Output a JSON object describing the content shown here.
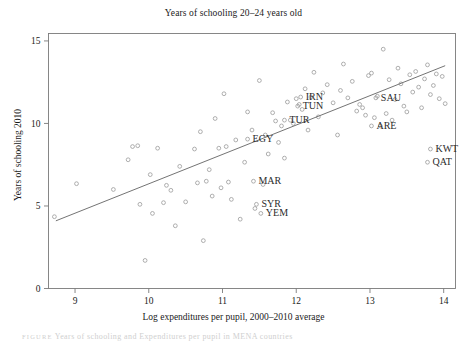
{
  "figure": {
    "title": "Years of schooling 20–24 years old",
    "caption_prefix": "FIGURE",
    "caption_text": "Years of schooling and Expenditures per pupil in MENA countries"
  },
  "chart_data": {
    "type": "scatter",
    "title": "Years of schooling 20–24 years old",
    "xlabel": "Log expenditures per pupil, 2000–2010 average",
    "ylabel": "Years of schooling 2010",
    "xlim": [
      8.64,
      14.16
    ],
    "ylim": [
      0,
      15.45
    ],
    "xticks": [
      9,
      10,
      11,
      12,
      13,
      14
    ],
    "yticks": [
      0,
      5,
      10,
      15
    ],
    "grid": false,
    "legend": "none",
    "marker": "open-circle",
    "marker_color": "#9a9a9a",
    "trendline": {
      "type": "linear-fit",
      "color": "#6b6b6b",
      "x_start": 8.74,
      "y_start": 4.1,
      "x_end": 14.02,
      "y_end": 13.5
    },
    "points": [
      {
        "x": 8.72,
        "y": 4.35
      },
      {
        "x": 9.02,
        "y": 6.35
      },
      {
        "x": 9.52,
        "y": 6.0
      },
      {
        "x": 9.72,
        "y": 7.8
      },
      {
        "x": 9.78,
        "y": 8.6
      },
      {
        "x": 9.85,
        "y": 8.65
      },
      {
        "x": 9.88,
        "y": 5.1
      },
      {
        "x": 9.95,
        "y": 1.7
      },
      {
        "x": 10.02,
        "y": 6.9
      },
      {
        "x": 10.05,
        "y": 4.55
      },
      {
        "x": 10.12,
        "y": 8.5
      },
      {
        "x": 10.2,
        "y": 5.2
      },
      {
        "x": 10.24,
        "y": 6.25
      },
      {
        "x": 10.3,
        "y": 5.95
      },
      {
        "x": 10.36,
        "y": 3.8
      },
      {
        "x": 10.42,
        "y": 7.4
      },
      {
        "x": 10.5,
        "y": 5.25
      },
      {
        "x": 10.62,
        "y": 8.45
      },
      {
        "x": 10.66,
        "y": 6.4
      },
      {
        "x": 10.7,
        "y": 9.5
      },
      {
        "x": 10.74,
        "y": 2.9
      },
      {
        "x": 10.78,
        "y": 6.5
      },
      {
        "x": 10.82,
        "y": 7.2
      },
      {
        "x": 10.86,
        "y": 5.6
      },
      {
        "x": 10.9,
        "y": 10.3
      },
      {
        "x": 10.95,
        "y": 8.5
      },
      {
        "x": 10.98,
        "y": 6.1
      },
      {
        "x": 11.02,
        "y": 11.8
      },
      {
        "x": 11.05,
        "y": 8.6
      },
      {
        "x": 11.08,
        "y": 6.45
      },
      {
        "x": 11.12,
        "y": 5.4
      },
      {
        "x": 11.18,
        "y": 9.0
      },
      {
        "x": 11.24,
        "y": 4.2
      },
      {
        "x": 11.3,
        "y": 7.65
      },
      {
        "x": 11.34,
        "y": 10.7
      },
      {
        "x": 11.4,
        "y": 9.6
      },
      {
        "x": 11.44,
        "y": 4.85
      },
      {
        "x": 11.5,
        "y": 12.6
      },
      {
        "x": 11.55,
        "y": 6.3
      },
      {
        "x": 11.58,
        "y": 9.3
      },
      {
        "x": 11.62,
        "y": 8.15
      },
      {
        "x": 11.68,
        "y": 10.65
      },
      {
        "x": 11.72,
        "y": 10.15
      },
      {
        "x": 11.76,
        "y": 8.85
      },
      {
        "x": 11.8,
        "y": 9.85
      },
      {
        "x": 11.84,
        "y": 7.9
      },
      {
        "x": 11.88,
        "y": 11.3
      },
      {
        "x": 11.92,
        "y": 10.2
      },
      {
        "x": 11.96,
        "y": 10.0
      },
      {
        "x": 12.0,
        "y": 11.5
      },
      {
        "x": 12.04,
        "y": 11.15
      },
      {
        "x": 12.08,
        "y": 10.85
      },
      {
        "x": 12.12,
        "y": 12.1
      },
      {
        "x": 12.16,
        "y": 9.6
      },
      {
        "x": 12.2,
        "y": 11.6
      },
      {
        "x": 12.24,
        "y": 13.1
      },
      {
        "x": 12.3,
        "y": 10.4
      },
      {
        "x": 12.36,
        "y": 11.85
      },
      {
        "x": 12.42,
        "y": 12.35
      },
      {
        "x": 12.5,
        "y": 11.25
      },
      {
        "x": 12.56,
        "y": 9.3
      },
      {
        "x": 12.6,
        "y": 12.0
      },
      {
        "x": 12.64,
        "y": 13.6
      },
      {
        "x": 12.7,
        "y": 11.55
      },
      {
        "x": 12.76,
        "y": 12.55
      },
      {
        "x": 12.82,
        "y": 10.75
      },
      {
        "x": 12.86,
        "y": 11.15
      },
      {
        "x": 12.9,
        "y": 10.95
      },
      {
        "x": 12.94,
        "y": 10.5
      },
      {
        "x": 12.98,
        "y": 12.9
      },
      {
        "x": 13.02,
        "y": 13.05
      },
      {
        "x": 13.06,
        "y": 10.35
      },
      {
        "x": 13.1,
        "y": 11.65
      },
      {
        "x": 13.14,
        "y": 9.85
      },
      {
        "x": 13.18,
        "y": 14.5
      },
      {
        "x": 13.22,
        "y": 10.6
      },
      {
        "x": 13.26,
        "y": 12.65
      },
      {
        "x": 13.3,
        "y": 10.2
      },
      {
        "x": 13.34,
        "y": 11.45
      },
      {
        "x": 13.38,
        "y": 13.35
      },
      {
        "x": 13.42,
        "y": 12.4
      },
      {
        "x": 13.46,
        "y": 11.05
      },
      {
        "x": 13.5,
        "y": 10.7
      },
      {
        "x": 13.54,
        "y": 12.95
      },
      {
        "x": 13.58,
        "y": 11.9
      },
      {
        "x": 13.62,
        "y": 13.15
      },
      {
        "x": 13.66,
        "y": 12.2
      },
      {
        "x": 13.7,
        "y": 10.95
      },
      {
        "x": 13.74,
        "y": 12.7
      },
      {
        "x": 13.78,
        "y": 13.55
      },
      {
        "x": 13.82,
        "y": 11.75
      },
      {
        "x": 13.86,
        "y": 12.3
      },
      {
        "x": 13.9,
        "y": 13.0
      },
      {
        "x": 13.94,
        "y": 11.5
      },
      {
        "x": 13.98,
        "y": 12.85
      },
      {
        "x": 14.02,
        "y": 11.2
      }
    ],
    "labeled_points": [
      {
        "code": "IRN",
        "x": 12.06,
        "y": 11.6,
        "label_dx": 5,
        "label_dy": 3
      },
      {
        "code": "TUN",
        "x": 12.02,
        "y": 11.05,
        "label_dx": 5,
        "label_dy": 3
      },
      {
        "code": "TUR",
        "x": 11.84,
        "y": 10.2,
        "label_dx": 5,
        "label_dy": 3
      },
      {
        "code": "EGY",
        "x": 11.34,
        "y": 9.05,
        "label_dx": 5,
        "label_dy": 3
      },
      {
        "code": "MAR",
        "x": 11.42,
        "y": 6.5,
        "label_dx": 5,
        "label_dy": 3
      },
      {
        "code": "SYR",
        "x": 11.46,
        "y": 5.1,
        "label_dx": 5,
        "label_dy": 3
      },
      {
        "code": "YEM",
        "x": 11.52,
        "y": 4.55,
        "label_dx": 5,
        "label_dy": 3
      },
      {
        "code": "SAU",
        "x": 13.08,
        "y": 11.55,
        "label_dx": 5,
        "label_dy": 3
      },
      {
        "code": "ARE",
        "x": 13.02,
        "y": 9.85,
        "label_dx": 5,
        "label_dy": 3
      },
      {
        "code": "KWT",
        "x": 13.82,
        "y": 8.45,
        "label_dx": 5,
        "label_dy": 3
      },
      {
        "code": "QAT",
        "x": 13.78,
        "y": 7.65,
        "label_dx": 5,
        "label_dy": 3
      }
    ]
  }
}
